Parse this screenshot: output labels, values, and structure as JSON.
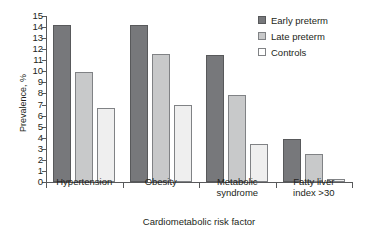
{
  "chart_data": {
    "type": "bar",
    "title": "",
    "xlabel": "Cardiometabolic risk factor",
    "ylabel": "Prevalence, %",
    "ylim": [
      0,
      15
    ],
    "yticks": [
      0,
      1,
      2,
      3,
      4,
      5,
      6,
      7,
      8,
      9,
      10,
      11,
      12,
      13,
      14,
      15
    ],
    "grid": false,
    "legend_position": "top-right",
    "categories": [
      "Hypertension",
      "Obesity",
      "Metabolic syndrome",
      "Fatty liver index >30"
    ],
    "category_lines": [
      [
        "Hypertension"
      ],
      [
        "Obesity"
      ],
      [
        "Metabolic",
        "syndrome"
      ],
      [
        "Fatty liver",
        "index >30"
      ]
    ],
    "series": [
      {
        "name": "Early preterm",
        "color": "#77787b",
        "values": [
          14.2,
          14.2,
          11.5,
          3.85
        ]
      },
      {
        "name": "Late preterm",
        "color": "#c8c9ca",
        "values": [
          9.9,
          11.6,
          7.9,
          2.5
        ]
      },
      {
        "name": "Controls",
        "color": "#efefef",
        "values": [
          6.7,
          7.0,
          3.45,
          0.3
        ]
      }
    ]
  },
  "axis": {
    "ylabel": "Prevalence, %",
    "xlabel": "Cardiometabolic risk factor"
  },
  "legend": {
    "items": [
      {
        "label": "Early preterm"
      },
      {
        "label": "Late preterm"
      },
      {
        "label": "Controls"
      }
    ]
  }
}
